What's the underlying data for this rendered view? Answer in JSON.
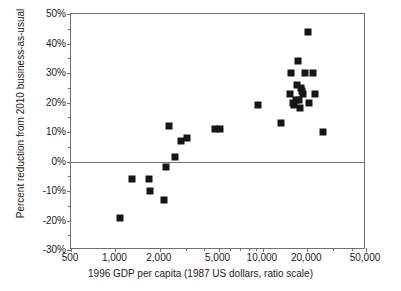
{
  "chart_data": {
    "type": "scatter",
    "title": "",
    "xlabel": "1996 GDP per capita (1987 US dollars, ratio scale)",
    "ylabel": "Percent reduction from 2010 business-as-usual",
    "xscale": "log",
    "yscale": "linear",
    "xlim": [
      500,
      50000
    ],
    "ylim": [
      -30,
      50
    ],
    "grid": false,
    "legend": null,
    "x_tick_labels": [
      "500",
      "1,000",
      "2,000",
      "5,000",
      "10,000",
      "20,000",
      "50,000"
    ],
    "x_tick_values": [
      500,
      1000,
      2000,
      5000,
      10000,
      20000,
      50000
    ],
    "x_minor_tick_values": [
      3000,
      4000,
      6000,
      7000,
      8000,
      9000,
      30000,
      40000
    ],
    "y_tick_labels": [
      "50%",
      "40%",
      "30%",
      "20%",
      "10%",
      "0%",
      "-10%",
      "-20%",
      "-30%"
    ],
    "y_tick_values": [
      50,
      40,
      30,
      20,
      10,
      0,
      -10,
      -20,
      -30
    ],
    "reference_line_y": 0,
    "marker": "filled-square",
    "marker_color": "#161616",
    "frame_color": "#6f6f6f",
    "points": [
      {
        "x": 1080,
        "y": -19
      },
      {
        "x": 1300,
        "y": -6
      },
      {
        "x": 1700,
        "y": -6
      },
      {
        "x": 1720,
        "y": -10
      },
      {
        "x": 2120,
        "y": -13
      },
      {
        "x": 2200,
        "y": -2
      },
      {
        "x": 2300,
        "y": 12
      },
      {
        "x": 2550,
        "y": 1.5
      },
      {
        "x": 2800,
        "y": 7
      },
      {
        "x": 3050,
        "y": 8
      },
      {
        "x": 4700,
        "y": 11
      },
      {
        "x": 5100,
        "y": 11
      },
      {
        "x": 9300,
        "y": 19
      },
      {
        "x": 13200,
        "y": 13
      },
      {
        "x": 15200,
        "y": 23
      },
      {
        "x": 15600,
        "y": 30
      },
      {
        "x": 16000,
        "y": 20
      },
      {
        "x": 16300,
        "y": 19
      },
      {
        "x": 16700,
        "y": 21
      },
      {
        "x": 17000,
        "y": 26
      },
      {
        "x": 17300,
        "y": 34
      },
      {
        "x": 17600,
        "y": 21
      },
      {
        "x": 17800,
        "y": 18
      },
      {
        "x": 18100,
        "y": 25
      },
      {
        "x": 18400,
        "y": 24
      },
      {
        "x": 18800,
        "y": 23
      },
      {
        "x": 19200,
        "y": 30
      },
      {
        "x": 20200,
        "y": 44
      },
      {
        "x": 20600,
        "y": 20
      },
      {
        "x": 21800,
        "y": 30
      },
      {
        "x": 22500,
        "y": 23
      },
      {
        "x": 25500,
        "y": 10
      }
    ]
  }
}
